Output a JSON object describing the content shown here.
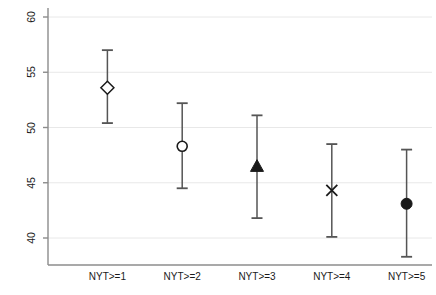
{
  "chart_data": {
    "type": "scatter",
    "title": "",
    "subtitle": "",
    "xlabel": "",
    "ylabel": "Percent issues gridlocked",
    "categories": [
      "NYT>=1",
      "NYT>=2",
      "NYT>=3",
      "NYT>=4",
      "NYT>=5"
    ],
    "values": [
      53.6,
      48.3,
      46.5,
      44.3,
      43.1
    ],
    "errors_low": [
      50.4,
      44.5,
      41.8,
      40.1,
      38.3
    ],
    "errors_high": [
      57.0,
      52.2,
      51.1,
      48.5,
      48.0
    ],
    "markers": [
      "open-diamond",
      "open-circle",
      "filled-triangle",
      "cross-x",
      "filled-circle"
    ],
    "ylim": [
      38.3,
      61.0
    ],
    "yticks": [
      40,
      45,
      50,
      55,
      60
    ],
    "ytick_labels": [
      "40",
      "45",
      "50",
      "55",
      "60"
    ],
    "xlim": [
      0.5,
      5.5
    ],
    "grid": "horizontal",
    "legend": "none",
    "series": [
      {
        "name": "Percent issues gridlocked",
        "points": [
          {
            "x": "NYT>=1",
            "y": 53.6,
            "low": 50.4,
            "high": 57.0,
            "marker": "open-diamond"
          },
          {
            "x": "NYT>=2",
            "y": 48.3,
            "low": 44.5,
            "high": 52.2,
            "marker": "open-circle"
          },
          {
            "x": "NYT>=3",
            "y": 46.5,
            "low": 41.8,
            "high": 51.1,
            "marker": "filled-triangle"
          },
          {
            "x": "NYT>=4",
            "y": 44.3,
            "low": 40.1,
            "high": 48.5,
            "marker": "cross-x"
          },
          {
            "x": "NYT>=5",
            "y": 43.1,
            "low": 38.3,
            "high": 48.0,
            "marker": "filled-circle"
          }
        ]
      }
    ],
    "colors": {
      "marker": "#1a1a1a",
      "errorbar": "#555555",
      "grid": "#e8e8e8",
      "axis": "#8c8c8c",
      "text": "#1a1a1a",
      "background": "#ffffff"
    }
  }
}
